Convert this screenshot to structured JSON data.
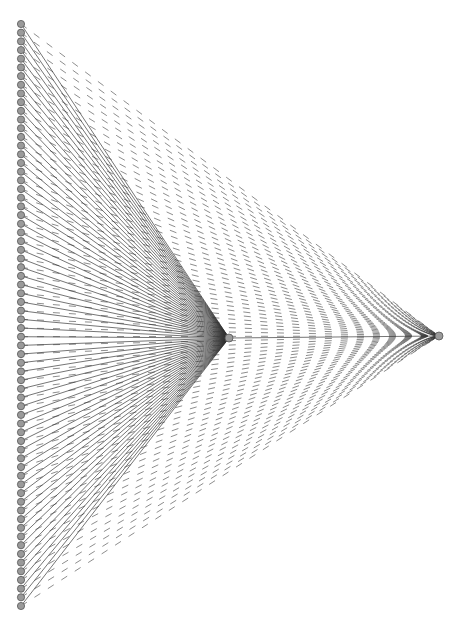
{
  "diagram": {
    "type": "network-graph",
    "layout": "left column of leaf nodes connected to two hub nodes",
    "canvas": {
      "width": 463,
      "height": 630
    },
    "colors": {
      "node_fill": "#9a9a9a",
      "node_stroke": "#555555",
      "edge": "#333333",
      "background": "#ffffff"
    },
    "leaf_nodes": {
      "count": 68,
      "x": 21,
      "y_start": 24,
      "y_end": 606,
      "radius": 3.6
    },
    "hubs": [
      {
        "id": "hub-middle",
        "x": 229,
        "y": 338,
        "radius": 4
      },
      {
        "id": "hub-right",
        "x": 439,
        "y": 336,
        "radius": 4
      }
    ],
    "edges": [
      {
        "from": "each-leaf",
        "to": "hub-middle",
        "style": "solid"
      },
      {
        "from": "each-leaf",
        "to": "hub-right",
        "style": "dashed"
      },
      {
        "from": "hub-middle",
        "to": "hub-right",
        "style": "solid"
      }
    ]
  }
}
